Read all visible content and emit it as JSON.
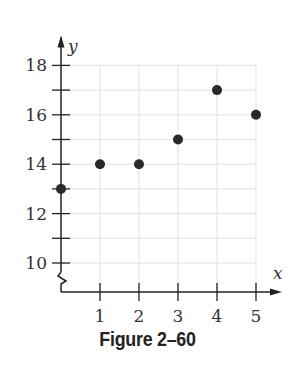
{
  "chart_data": {
    "type": "scatter",
    "title": "",
    "caption": "Figure 2–60",
    "xlabel": "x",
    "ylabel": "y",
    "x": [
      0,
      1,
      2,
      3,
      4,
      5
    ],
    "y": [
      13,
      14,
      14,
      15,
      17,
      16
    ],
    "points": [
      {
        "x": 0,
        "y": 13
      },
      {
        "x": 1,
        "y": 14
      },
      {
        "x": 2,
        "y": 14
      },
      {
        "x": 3,
        "y": 15
      },
      {
        "x": 4,
        "y": 17
      },
      {
        "x": 5,
        "y": 16
      }
    ],
    "x_ticks": [
      "1",
      "2",
      "3",
      "4",
      "5"
    ],
    "y_ticks": [
      "10",
      "12",
      "14",
      "16",
      "18"
    ],
    "xlim": [
      0,
      5
    ],
    "ylim": [
      10,
      18
    ],
    "y_axis_break": true,
    "grid": true,
    "legend": null
  },
  "colors": {
    "axis": "#222222",
    "grid": "#e0e0e0",
    "point": "#2a2a2a"
  }
}
